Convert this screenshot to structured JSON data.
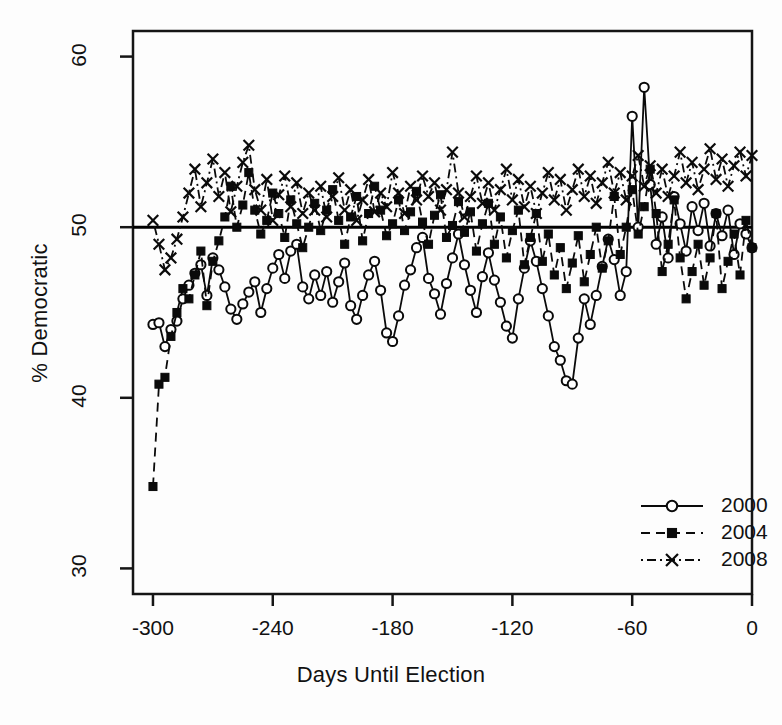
{
  "chart_data": {
    "type": "line",
    "title": "",
    "xlabel": "Days Until Election",
    "ylabel": "% Democratic",
    "xlim": [
      -310,
      0
    ],
    "ylim": [
      28.5,
      61.5
    ],
    "xticks": [
      "-300",
      "-240",
      "-180",
      "-120",
      "-60",
      "0"
    ],
    "xtick_values": [
      -300,
      -240,
      -180,
      -120,
      -60,
      0
    ],
    "yticks": [
      "30",
      "40",
      "50",
      "60"
    ],
    "ytick_values": [
      30,
      40,
      50,
      60
    ],
    "grid": false,
    "reference_line": {
      "y": 50,
      "label": "50% tie line",
      "color": "#000000",
      "width": 3
    },
    "legend": {
      "position": "bottom-right",
      "entries": [
        {
          "label": "2000",
          "marker": "open-circle",
          "line": "solid",
          "color": "#000000"
        },
        {
          "label": "2004",
          "marker": "filled-square",
          "line": "dashed",
          "color": "#000000"
        },
        {
          "label": "2008",
          "marker": "cross-x",
          "line": "dotdash",
          "color": "#000000"
        }
      ]
    },
    "series": [
      {
        "name": "2000",
        "marker": "open-circle",
        "line": "solid",
        "x": [
          -300,
          -297,
          -294,
          -291,
          -288,
          -285,
          -282,
          -279,
          -276,
          -273,
          -270,
          -267,
          -264,
          -261,
          -258,
          -255,
          -252,
          -249,
          -246,
          -243,
          -240,
          -237,
          -234,
          -231,
          -228,
          -225,
          -222,
          -219,
          -216,
          -213,
          -210,
          -207,
          -204,
          -201,
          -198,
          -195,
          -192,
          -189,
          -186,
          -183,
          -180,
          -177,
          -174,
          -171,
          -168,
          -165,
          -162,
          -159,
          -156,
          -153,
          -150,
          -147,
          -144,
          -141,
          -138,
          -135,
          -132,
          -129,
          -126,
          -123,
          -120,
          -117,
          -114,
          -111,
          -108,
          -105,
          -102,
          -99,
          -96,
          -93,
          -90,
          -87,
          -84,
          -81,
          -78,
          -75,
          -72,
          -69,
          -66,
          -63,
          -60,
          -57,
          -54,
          -51,
          -48,
          -45,
          -42,
          -39,
          -36,
          -33,
          -30,
          -27,
          -24,
          -21,
          -18,
          -15,
          -12,
          -9,
          -6,
          -3,
          0
        ],
        "y": [
          44.3,
          44.4,
          43.0,
          44.0,
          44.5,
          45.8,
          46.6,
          47.3,
          47.8,
          46.0,
          48.2,
          47.5,
          46.5,
          45.2,
          44.6,
          45.5,
          46.2,
          46.8,
          45.0,
          46.4,
          47.6,
          48.4,
          47.0,
          48.6,
          49.0,
          46.5,
          45.8,
          47.2,
          46.0,
          47.4,
          45.6,
          46.8,
          47.9,
          45.4,
          44.6,
          46.0,
          47.2,
          48.0,
          46.3,
          43.8,
          43.3,
          44.8,
          46.6,
          47.5,
          48.8,
          49.4,
          47.0,
          46.1,
          44.9,
          46.7,
          48.2,
          49.6,
          47.8,
          46.3,
          45.0,
          47.1,
          48.5,
          46.9,
          45.6,
          44.2,
          43.5,
          45.8,
          47.6,
          49.2,
          48.0,
          46.4,
          44.8,
          43.0,
          42.2,
          41.0,
          40.8,
          43.5,
          45.8,
          44.3,
          46.0,
          47.7,
          49.3,
          48.1,
          46.0,
          47.4,
          56.5,
          50.0,
          58.2,
          52.5,
          49.0,
          50.6,
          48.2,
          51.8,
          50.2,
          48.6,
          51.2,
          49.8,
          51.4,
          48.9,
          50.8,
          49.5,
          51.0,
          48.4,
          50.2,
          49.6,
          48.8
        ]
      },
      {
        "name": "2004",
        "marker": "filled-square",
        "line": "dashed",
        "x": [
          -300,
          -297,
          -294,
          -291,
          -288,
          -285,
          -282,
          -279,
          -276,
          -273,
          -270,
          -267,
          -264,
          -261,
          -258,
          -255,
          -252,
          -249,
          -246,
          -243,
          -240,
          -237,
          -234,
          -231,
          -228,
          -225,
          -222,
          -219,
          -216,
          -213,
          -210,
          -207,
          -204,
          -201,
          -198,
          -195,
          -192,
          -189,
          -186,
          -183,
          -180,
          -177,
          -174,
          -171,
          -168,
          -165,
          -162,
          -159,
          -156,
          -153,
          -150,
          -147,
          -144,
          -141,
          -138,
          -135,
          -132,
          -129,
          -126,
          -123,
          -120,
          -117,
          -114,
          -111,
          -108,
          -105,
          -102,
          -99,
          -96,
          -93,
          -90,
          -87,
          -84,
          -81,
          -78,
          -75,
          -72,
          -69,
          -66,
          -63,
          -60,
          -57,
          -54,
          -51,
          -48,
          -45,
          -42,
          -39,
          -36,
          -33,
          -30,
          -27,
          -24,
          -21,
          -18,
          -15,
          -12,
          -9,
          -6,
          -3,
          0
        ],
        "y": [
          34.8,
          40.8,
          41.2,
          43.6,
          45.0,
          46.4,
          45.8,
          47.2,
          48.6,
          45.4,
          48.0,
          49.2,
          50.6,
          52.4,
          50.0,
          51.3,
          53.2,
          51.0,
          49.6,
          50.4,
          52.0,
          50.8,
          49.4,
          51.6,
          50.2,
          48.8,
          50.0,
          51.4,
          49.8,
          51.0,
          52.2,
          50.4,
          49.0,
          50.6,
          51.8,
          49.2,
          50.8,
          52.4,
          51.0,
          49.5,
          50.2,
          51.6,
          49.8,
          50.9,
          52.1,
          50.3,
          49.0,
          50.7,
          51.9,
          49.4,
          50.1,
          51.5,
          49.7,
          50.9,
          48.6,
          50.2,
          51.4,
          49.0,
          50.6,
          48.2,
          49.8,
          51.0,
          47.8,
          49.4,
          50.8,
          48.0,
          49.6,
          47.2,
          48.8,
          46.4,
          47.9,
          49.5,
          46.8,
          48.4,
          50.0,
          47.6,
          49.2,
          51.8,
          48.4,
          50.0,
          52.2,
          49.6,
          51.2,
          53.4,
          50.8,
          47.4,
          49.0,
          51.6,
          48.2,
          45.8,
          47.4,
          49.0,
          46.6,
          48.2,
          50.8,
          46.4,
          48.0,
          49.6,
          47.2,
          50.4,
          48.8
        ]
      },
      {
        "name": "2008",
        "marker": "cross-x",
        "line": "dotdash",
        "x": [
          -300,
          -297,
          -294,
          -291,
          -288,
          -285,
          -282,
          -279,
          -276,
          -273,
          -270,
          -267,
          -264,
          -261,
          -258,
          -255,
          -252,
          -249,
          -246,
          -243,
          -240,
          -237,
          -234,
          -231,
          -228,
          -225,
          -222,
          -219,
          -216,
          -213,
          -210,
          -207,
          -204,
          -201,
          -198,
          -195,
          -192,
          -189,
          -186,
          -183,
          -180,
          -177,
          -174,
          -171,
          -168,
          -165,
          -162,
          -159,
          -156,
          -153,
          -150,
          -147,
          -144,
          -141,
          -138,
          -135,
          -132,
          -129,
          -126,
          -123,
          -120,
          -117,
          -114,
          -111,
          -108,
          -105,
          -102,
          -99,
          -96,
          -93,
          -90,
          -87,
          -84,
          -81,
          -78,
          -75,
          -72,
          -69,
          -66,
          -63,
          -60,
          -57,
          -54,
          -51,
          -48,
          -45,
          -42,
          -39,
          -36,
          -33,
          -30,
          -27,
          -24,
          -21,
          -18,
          -15,
          -12,
          -9,
          -6,
          -3,
          0
        ],
        "y": [
          50.4,
          49.0,
          47.5,
          48.2,
          49.3,
          50.6,
          52.0,
          53.4,
          51.2,
          52.6,
          54.0,
          51.8,
          53.2,
          50.9,
          52.4,
          53.8,
          54.8,
          52.2,
          51.0,
          52.8,
          50.4,
          51.9,
          53.0,
          51.2,
          52.6,
          50.8,
          52.0,
          51.0,
          52.4,
          50.6,
          51.8,
          52.9,
          51.0,
          52.2,
          50.4,
          51.6,
          52.8,
          50.9,
          52.0,
          51.2,
          53.2,
          52.0,
          50.8,
          52.4,
          51.6,
          53.0,
          51.8,
          52.6,
          51.0,
          52.2,
          54.4,
          52.0,
          50.6,
          51.8,
          53.0,
          51.4,
          52.6,
          51.0,
          52.2,
          53.4,
          51.6,
          52.8,
          51.2,
          52.4,
          50.8,
          52.0,
          53.2,
          51.6,
          52.8,
          51.0,
          52.2,
          53.4,
          51.8,
          53.0,
          51.4,
          52.6,
          53.8,
          52.0,
          53.2,
          51.6,
          53.0,
          54.2,
          52.4,
          53.6,
          52.0,
          53.4,
          51.8,
          53.0,
          54.4,
          52.6,
          53.8,
          52.2,
          53.4,
          54.6,
          52.8,
          54.0,
          52.4,
          53.6,
          54.4,
          53.0,
          54.2
        ]
      }
    ]
  },
  "axes": {
    "xlabel": "Days Until Election",
    "ylabel": "% Democratic"
  },
  "legend": {
    "items": [
      {
        "label": "2000"
      },
      {
        "label": "2004"
      },
      {
        "label": "2008"
      }
    ]
  }
}
